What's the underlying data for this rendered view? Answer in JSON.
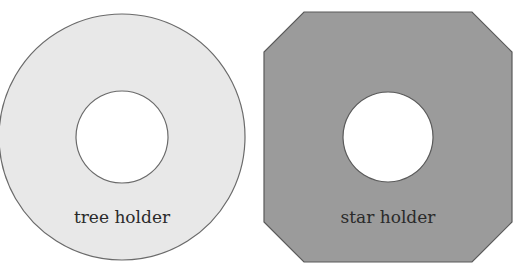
{
  "diagram": {
    "shapes": [
      {
        "id": "tree-holder",
        "type": "ring",
        "label": "tree holder",
        "fill": "#e8e8e8",
        "stroke": "#6a6a6a",
        "center": [
          122,
          137
        ],
        "outer_radius": 123,
        "inner_radius": 46
      },
      {
        "id": "star-holder",
        "type": "octagon-with-hole",
        "label": "star holder",
        "fill": "#9b9b9b",
        "stroke": "#5a5a5a",
        "bounds": [
          264,
          12,
          512,
          262
        ],
        "chamfer": 40,
        "hole_center": [
          388,
          137
        ],
        "hole_radius": 45
      }
    ]
  }
}
